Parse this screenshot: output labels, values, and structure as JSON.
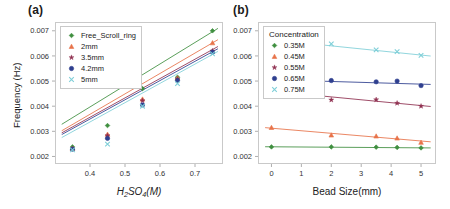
{
  "figure": {
    "panels": [
      {
        "key": "a",
        "label": "(a)",
        "xlabel_html": "H<sub>2</sub>SO<sub>4</sub>(M)",
        "xlabel": "H2SO4(M)",
        "ylabel": "Frequency (Hz)",
        "legend_title": "",
        "xticks": [
          "0.4",
          "0.5",
          "0.6",
          "0.7"
        ],
        "yticks": [
          "0.002",
          "0.003",
          "0.004",
          "0.005",
          "0.006",
          "0.007"
        ]
      },
      {
        "key": "b",
        "label": "(b)",
        "xlabel": "Bead Size(mm)",
        "ylabel": "",
        "legend_title": "Concentration",
        "xticks": [
          "0",
          "1",
          "2",
          "3",
          "4",
          "5"
        ],
        "yticks": [
          "0.002",
          "0.003",
          "0.004",
          "0.005",
          "0.006",
          "0.007"
        ]
      }
    ]
  },
  "chart_data": [
    {
      "type": "scatter",
      "panel": "a",
      "title": "(a)",
      "xlabel": "H2SO4(M)",
      "ylabel": "Frequency (Hz)",
      "xlim": [
        0.3,
        0.78
      ],
      "ylim": [
        0.0017,
        0.00735
      ],
      "xticks": [
        0.4,
        0.5,
        0.6,
        0.7
      ],
      "yticks": [
        0.002,
        0.003,
        0.004,
        0.005,
        0.006,
        0.007
      ],
      "grid": false,
      "legend_position": "upper-left",
      "x": [
        0.35,
        0.45,
        0.55,
        0.65,
        0.75
      ],
      "series": [
        {
          "name": "Free_Scroll_ring",
          "color": "#3f8f3f",
          "marker": "diamond",
          "values": [
            0.00238,
            0.00323,
            0.0047,
            0.00515,
            0.007
          ],
          "fit": {
            "intercept": 0.00055,
            "slope": 0.00855
          }
        },
        {
          "name": "2mm",
          "color": "#e8734a",
          "marker": "triangle",
          "values": [
            0.00232,
            0.00288,
            0.00428,
            0.00512,
            0.00652
          ],
          "fit": {
            "intercept": 0.00043,
            "slope": 0.00812
          }
        },
        {
          "name": "3.5mm",
          "color": "#8f3050",
          "marker": "star",
          "values": [
            0.00231,
            0.00283,
            0.00422,
            0.00508,
            0.0062
          ],
          "fit": {
            "intercept": 0.00048,
            "slope": 0.0077
          }
        },
        {
          "name": "4.2mm",
          "color": "#2f3f8f",
          "marker": "circle",
          "values": [
            0.00229,
            0.00272,
            0.00405,
            0.00502,
            0.00615
          ],
          "fit": {
            "intercept": 0.00043,
            "slope": 0.00765
          }
        },
        {
          "name": "5mm",
          "color": "#7fcfd8",
          "marker": "x",
          "values": [
            0.00226,
            0.00249,
            0.004,
            0.0049,
            0.00608
          ],
          "fit": {
            "intercept": 0.0003,
            "slope": 0.00768
          }
        }
      ]
    },
    {
      "type": "scatter",
      "panel": "b",
      "title": "(b)",
      "xlabel": "Bead Size(mm)",
      "ylabel": "Frequency (Hz)",
      "xlim": [
        -0.45,
        5.5
      ],
      "ylim": [
        0.0017,
        0.00735
      ],
      "xticks": [
        0,
        1,
        2,
        3,
        4,
        5
      ],
      "yticks": [
        0.002,
        0.003,
        0.004,
        0.005,
        0.006,
        0.007
      ],
      "grid": false,
      "legend_title": "Concentration",
      "legend_position": "upper-left",
      "x": [
        0,
        2,
        3.5,
        4.2,
        5
      ],
      "series": [
        {
          "name": "0.35M",
          "color": "#3f8f3f",
          "marker": "diamond",
          "values": [
            0.00238,
            0.00238,
            0.00237,
            0.00236,
            0.00234
          ],
          "fit": {
            "intercept": 0.002385,
            "slope": -8.5e-06
          }
        },
        {
          "name": "0.45M",
          "color": "#e8734a",
          "marker": "triangle",
          "values": [
            0.00315,
            0.00285,
            0.00281,
            0.00273,
            0.00256
          ],
          "fit": {
            "intercept": 0.003125,
            "slope": -0.000102
          }
        },
        {
          "name": "0.55M",
          "color": "#8f3050",
          "marker": "star",
          "values": [
            0.00465,
            0.00425,
            0.00426,
            0.00412,
            0.004
          ],
          "fit": {
            "intercept": 0.0046,
            "slope": -0.000115
          }
        },
        {
          "name": "0.65M",
          "color": "#2f3f8f",
          "marker": "circle",
          "values": [
            0.00505,
            0.00502,
            0.00497,
            0.005,
            0.00482
          ],
          "fit": {
            "intercept": 0.005055,
            "slope": -3.55e-05
          }
        },
        {
          "name": "0.75M",
          "color": "#7fcfd8",
          "marker": "x",
          "values": [
            0.00665,
            0.00648,
            0.00624,
            0.00617,
            0.00602
          ],
          "fit": {
            "intercept": 0.006645,
            "slope": -0.000122
          }
        }
      ]
    }
  ]
}
